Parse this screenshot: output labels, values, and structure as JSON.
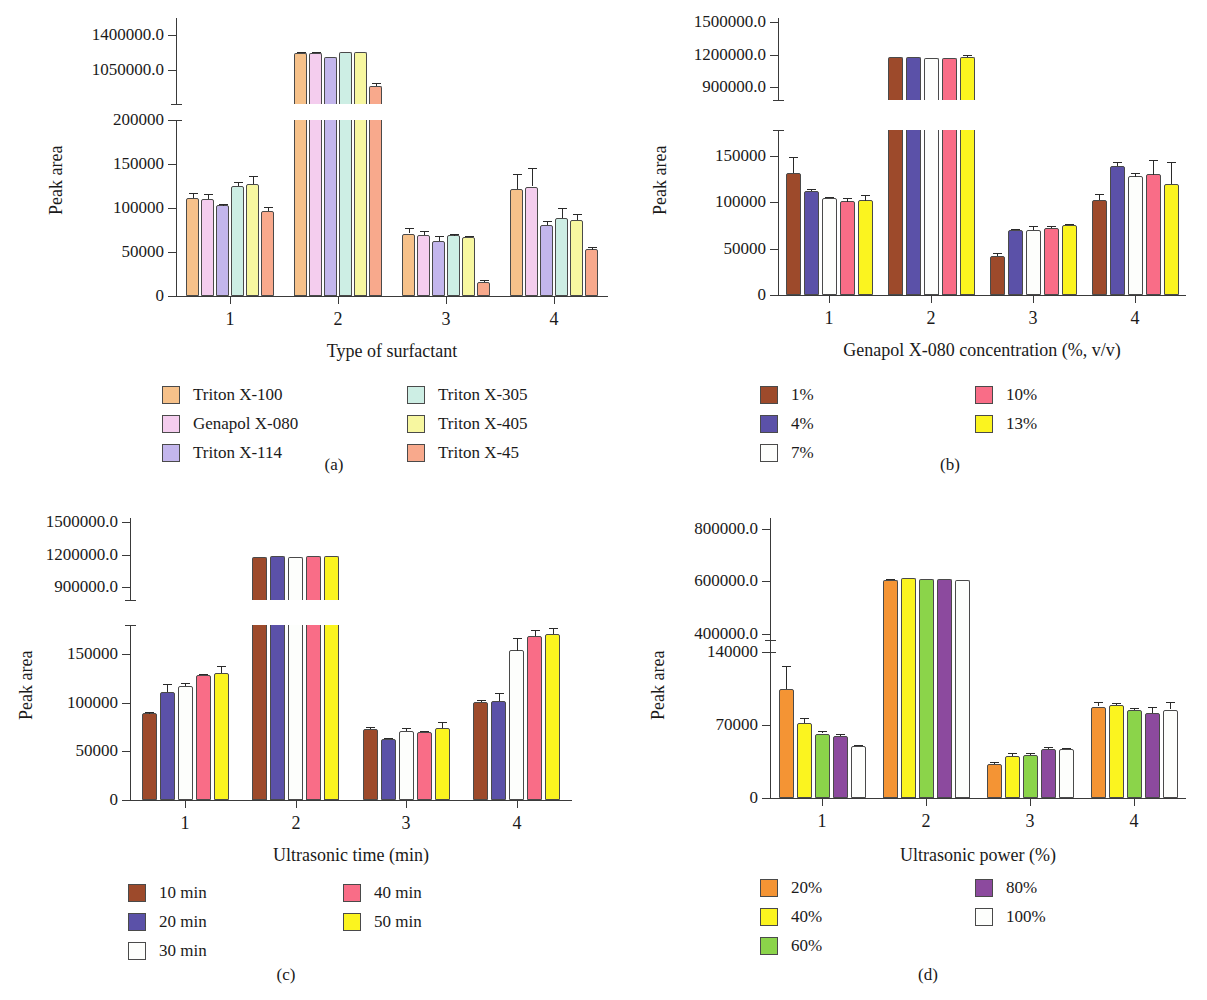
{
  "figure": {
    "ylabel": "Peak area",
    "panel_letters": [
      "(a)",
      "(b)",
      "(c)",
      "(d)"
    ]
  },
  "chart_data": [
    {
      "panel": "(a)",
      "type": "bar",
      "title": "",
      "xlabel": "Type of surfactant",
      "ylabel": "Peak area",
      "categories": [
        "1",
        "2",
        "3",
        "4"
      ],
      "lower_axis": {
        "ticks": [
          0,
          50000,
          100000,
          150000,
          200000
        ],
        "ticklabels": [
          "0",
          "50000",
          "100000",
          "150000",
          "200000"
        ],
        "ylim": [
          0,
          200000
        ]
      },
      "upper_axis": {
        "ticks": [
          1050000,
          1400000
        ],
        "ticklabels": [
          "1050000.0",
          "1400000.0"
        ],
        "ylim": [
          700000,
          1575000
        ]
      },
      "broken_axis": true,
      "legend_position": "below",
      "series": [
        {
          "name": "Triton X-100",
          "color": "#f6c18a",
          "values": [
            111000,
            1220000,
            71000,
            122000
          ],
          "errors": [
            6000,
            14000,
            6000,
            17000
          ]
        },
        {
          "name": "Genapol X-080",
          "color": "#f4cdee",
          "values": [
            110000,
            1222000,
            69000,
            124000
          ],
          "errors": [
            6000,
            12000,
            5000,
            21000
          ]
        },
        {
          "name": "Triton X-114",
          "color": "#c3b6ec",
          "values": [
            103000,
            1182000,
            62000,
            81000
          ],
          "errors": [
            2000,
            6000,
            6000,
            4000
          ]
        },
        {
          "name": "Triton X-305",
          "color": "#cdeee4",
          "values": [
            125000,
            1230000,
            69000,
            89000
          ],
          "errors": [
            5000,
            9000,
            2000,
            11000
          ]
        },
        {
          "name": "Triton X-405",
          "color": "#f7f7a0",
          "values": [
            127000,
            1228000,
            67000,
            86000
          ],
          "errors": [
            9000,
            8000,
            1000,
            7000
          ]
        },
        {
          "name": "Triton X-45",
          "color": "#f8a98c",
          "values": [
            97000,
            880000,
            16000,
            53000
          ],
          "errors": [
            4000,
            32000,
            2000,
            3000
          ]
        }
      ]
    },
    {
      "panel": "(b)",
      "type": "bar",
      "title": "",
      "xlabel": "Genapol X-080 concentration (%, v/v)",
      "ylabel": "Peak area",
      "categories": [
        "1",
        "2",
        "3",
        "4"
      ],
      "lower_axis": {
        "ticks": [
          0,
          50000,
          100000,
          150000
        ],
        "ticklabels": [
          "0",
          "50000",
          "100000",
          "150000"
        ],
        "ylim": [
          0,
          178000
        ]
      },
      "upper_axis": {
        "ticks": [
          900000,
          1200000,
          1500000
        ],
        "ticklabels": [
          "900000.0",
          "1200000.0",
          "1500000.0"
        ],
        "ylim": [
          780000,
          1540000
        ]
      },
      "broken_axis": true,
      "legend_position": "below",
      "series": [
        {
          "name": "1%",
          "color": "#9d4a2b",
          "values": [
            132000,
            1175000,
            42000,
            103000
          ],
          "errors": [
            17000,
            6000,
            3000,
            6000
          ]
        },
        {
          "name": "4%",
          "color": "#5b51a8",
          "values": [
            112000,
            1178000,
            70000,
            139000
          ],
          "errors": [
            2000,
            5000,
            1000,
            4000
          ]
        },
        {
          "name": "7%",
          "color": "#fdfefc",
          "values": [
            105000,
            1172000,
            70000,
            128000
          ],
          "errors": [
            1000,
            4000,
            4000,
            4000
          ]
        },
        {
          "name": "10%",
          "color": "#f96d87",
          "values": [
            101000,
            1168000,
            72000,
            130000
          ],
          "errors": [
            4000,
            7000,
            2000,
            16000
          ]
        },
        {
          "name": "13%",
          "color": "#fbf41f",
          "values": [
            102000,
            1180000,
            76000,
            120000
          ],
          "errors": [
            6000,
            14000,
            1000,
            24000
          ]
        }
      ]
    },
    {
      "panel": "(c)",
      "type": "bar",
      "title": "",
      "xlabel": "Ultrasonic time (min)",
      "ylabel": "Peak area",
      "categories": [
        "1",
        "2",
        "3",
        "4"
      ],
      "lower_axis": {
        "ticks": [
          0,
          50000,
          100000,
          150000
        ],
        "ticklabels": [
          "0",
          "50000",
          "100000",
          "150000"
        ],
        "ylim": [
          0,
          180000
        ]
      },
      "upper_axis": {
        "ticks": [
          900000,
          1200000,
          1500000
        ],
        "ticklabels": [
          "900000.0",
          "1200000.0",
          "1500000.0"
        ],
        "ylim": [
          780000,
          1540000
        ]
      },
      "broken_axis": true,
      "legend_position": "below",
      "series": [
        {
          "name": "10 min",
          "color": "#9d4a2b",
          "values": [
            89000,
            1180000,
            73000,
            101000
          ],
          "errors": [
            2000,
            5000,
            2000,
            2000
          ]
        },
        {
          "name": "20 min",
          "color": "#5b51a8",
          "values": [
            111000,
            1190000,
            63000,
            102000
          ],
          "errors": [
            8000,
            4000,
            1000,
            8000
          ]
        },
        {
          "name": "30 min",
          "color": "#fdfefc",
          "values": [
            117000,
            1180000,
            71000,
            154000
          ],
          "errors": [
            3000,
            4000,
            3000,
            13000
          ]
        },
        {
          "name": "40 min",
          "color": "#f96d87",
          "values": [
            129000,
            1192000,
            70000,
            169000
          ],
          "errors": [
            1000,
            5000,
            1000,
            6000
          ]
        },
        {
          "name": "50 min",
          "color": "#fbf41f",
          "values": [
            131000,
            1190000,
            74000,
            171000
          ],
          "errors": [
            7000,
            4000,
            6000,
            6000
          ]
        }
      ]
    },
    {
      "panel": "(d)",
      "type": "bar",
      "title": "",
      "xlabel": "Ultrasonic power (%)",
      "ylabel": "Peak area",
      "categories": [
        "1",
        "2",
        "3",
        "4"
      ],
      "lower_axis": {
        "ticks": [
          0,
          70000,
          140000
        ],
        "ticklabels": [
          "0",
          "70000",
          "140000"
        ],
        "ylim": [
          0,
          152000
        ]
      },
      "upper_axis": {
        "ticks": [
          400000,
          600000,
          800000
        ],
        "ticklabels": [
          "400000.0",
          "600000.0",
          "800000.0"
        ],
        "ylim": [
          330000,
          840000
        ]
      },
      "broken_axis": true,
      "legend_position": "below",
      "series": [
        {
          "name": "20%",
          "color": "#f49434",
          "values": [
            105000,
            605000,
            33000,
            88000
          ],
          "errors": [
            22000,
            4000,
            2000,
            4000
          ]
        },
        {
          "name": "40%",
          "color": "#fbf41f",
          "values": [
            72000,
            610000,
            40000,
            89000
          ],
          "errors": [
            5000,
            3000,
            3000,
            2000
          ]
        },
        {
          "name": "60%",
          "color": "#8bd44a",
          "values": [
            62000,
            606000,
            41000,
            85000
          ],
          "errors": [
            2000,
            3000,
            2000,
            2000
          ]
        },
        {
          "name": "80%",
          "color": "#8c4a9e",
          "values": [
            60000,
            606000,
            47000,
            82000
          ],
          "errors": [
            2000,
            3000,
            2000,
            6000
          ]
        },
        {
          "name": "100%",
          "color": "#fdfefc",
          "values": [
            50000,
            605000,
            47000,
            85000
          ],
          "errors": [
            1000,
            2000,
            1000,
            7000
          ]
        }
      ]
    }
  ]
}
